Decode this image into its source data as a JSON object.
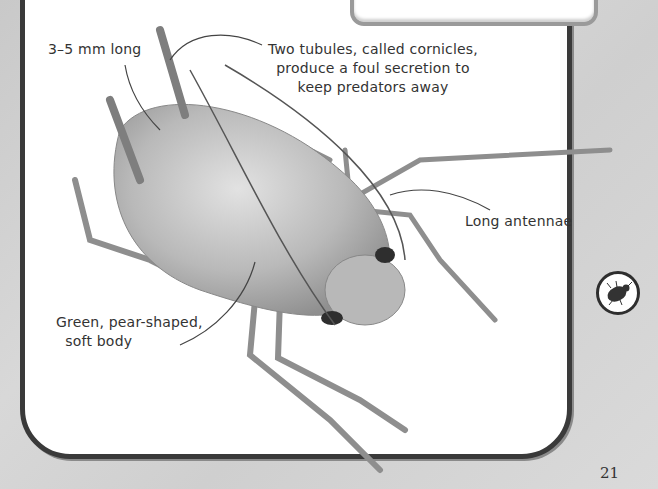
{
  "page": {
    "number": "21",
    "topic_icon": "beetle-icon"
  },
  "illustration": {
    "subject": "aphid"
  },
  "labels": {
    "size": "3–5 mm long",
    "cornicles": "Two tubules, called cornicles,\nproduce a foul secretion to\nkeep predators away",
    "antennae": "Long antennae",
    "body": "Green, pear-shaped,\n  soft body"
  },
  "colors": {
    "panel_border": "#3a3a3a",
    "background": "#d0d0d0",
    "text": "#333333"
  }
}
